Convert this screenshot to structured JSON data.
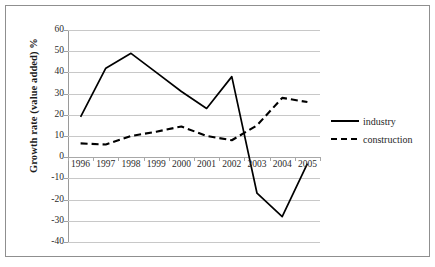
{
  "chart_data": {
    "type": "line",
    "title": "",
    "xlabel": "",
    "ylabel": "Growth rate (value added) %",
    "categories": [
      "1996",
      "1997",
      "1998",
      "1999",
      "2000",
      "2001",
      "2002",
      "2003",
      "2004",
      "2005"
    ],
    "x": [
      1996,
      1997,
      1998,
      1999,
      2000,
      2001,
      2002,
      2003,
      2004,
      2005
    ],
    "series": [
      {
        "name": "industry",
        "style": "solid",
        "color": "#000000",
        "values": [
          19,
          42,
          49,
          40,
          31,
          23,
          38,
          -17,
          -28,
          -3
        ]
      },
      {
        "name": "construction",
        "style": "dashed",
        "color": "#000000",
        "values": [
          6.5,
          6,
          10,
          12,
          14.5,
          10,
          8,
          15,
          28,
          26
        ]
      }
    ],
    "ylim": [
      -40,
      60
    ],
    "ytick_step": 10,
    "yticks": [
      60,
      50,
      40,
      30,
      20,
      10,
      0,
      -10,
      -20,
      -30,
      -40
    ],
    "ytick_labels": [
      "60",
      "50",
      "40",
      "30",
      "20",
      "10",
      "0",
      "-10",
      "-20",
      "-30",
      "-40"
    ],
    "grid": true,
    "grid_axis": "y",
    "legend_position": "right",
    "legend_entries": [
      "industry",
      "construction"
    ],
    "xaxis_label_position": "zero-line"
  },
  "legend": {
    "items": [
      {
        "label": "industry",
        "style": "solid"
      },
      {
        "label": "construction",
        "style": "dashed"
      }
    ]
  },
  "axes": {
    "y_title": "Growth rate (value added) %"
  },
  "colors": {
    "line": "#000000",
    "gridline": "#c8c8c8",
    "frame": "#8f8f8f",
    "text": "#2b2b2b",
    "background": "#ffffff"
  }
}
